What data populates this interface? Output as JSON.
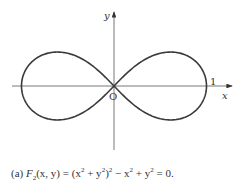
{
  "figure": {
    "curve": "lemniscate",
    "equation_text": "(x² + y²)² − x² + y² = 0",
    "origin_px": [
      114,
      86
    ],
    "scale_px": [
      92.5,
      96
    ],
    "colors": {
      "curve": "#3a3a3a",
      "axis": "#555555",
      "text": "#333333"
    },
    "labels": {
      "y_axis": "y",
      "x_axis": "x",
      "origin": "O",
      "x_intercept": "1"
    }
  },
  "caption": {
    "prefix": "(a) ",
    "func": "F",
    "func_sub": "2",
    "args": "(x, y) = (x",
    "p1": "2",
    "mid1": " + y",
    "p2": "2",
    "mid2": ")",
    "p3": "2",
    "mid3": " − x",
    "p4": "2",
    "mid4": " + y",
    "p5": "2",
    "suffix": " = 0."
  }
}
